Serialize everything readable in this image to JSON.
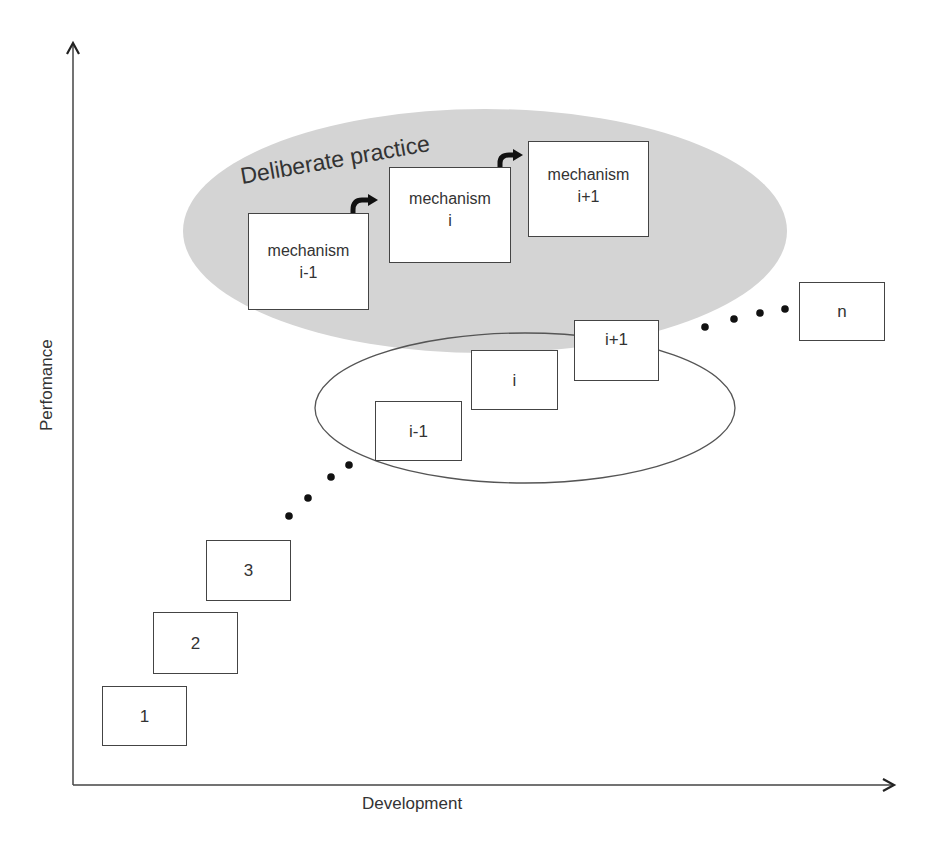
{
  "diagram": {
    "axes": {
      "x_label": "Development",
      "y_label": "Perfomance"
    },
    "region_title": "Deliberate practice",
    "colors": {
      "shaded_region": "#d4d4d4",
      "stroke": "#444444",
      "background": "#ffffff"
    },
    "stages": [
      {
        "id": "stage-1",
        "label": "1"
      },
      {
        "id": "stage-2",
        "label": "2"
      },
      {
        "id": "stage-3",
        "label": "3"
      },
      {
        "id": "stage-i-1",
        "label": "i-1"
      },
      {
        "id": "stage-i",
        "label": "i"
      },
      {
        "id": "stage-i+1",
        "label": "i+1"
      },
      {
        "id": "stage-n",
        "label": "n"
      }
    ],
    "mechanisms": [
      {
        "line1": "mechanism",
        "line2": "i-1"
      },
      {
        "line1": "mechanism",
        "line2": "i"
      },
      {
        "line1": "mechanism",
        "line2": "i+1"
      }
    ]
  }
}
